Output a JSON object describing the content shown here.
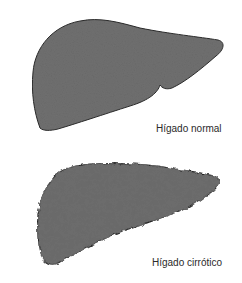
{
  "figure": {
    "normal_liver": {
      "label": "Hígado normal",
      "fill_color": "#707070",
      "outline_color": "#2b2b2b"
    },
    "cirrhotic_liver": {
      "label": "Hígado cirrótico",
      "fill_color": "#6a6a6a",
      "outline_color": "#262626",
      "nodule_color": "#3a3a3a"
    },
    "background_color": "#ffffff"
  }
}
